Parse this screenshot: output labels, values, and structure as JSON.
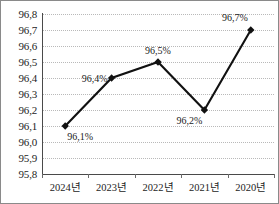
{
  "chart_data": {
    "type": "line",
    "title": "",
    "xlabel": "",
    "ylabel": "",
    "categories": [
      "2024년",
      "2023년",
      "2022년",
      "2021년",
      "2020년"
    ],
    "values": [
      96.1,
      96.4,
      96.5,
      96.2,
      96.7
    ],
    "point_labels": [
      "96,1%",
      "96,4%",
      "96,5%",
      "96,2%",
      "96,7%"
    ],
    "ylim": [
      95.8,
      96.8
    ],
    "ytick_labels": [
      "96,8",
      "96,7",
      "96,6",
      "96,5",
      "96,4",
      "96,3",
      "96,2",
      "96,1",
      "96,0",
      "95,9",
      "95,8"
    ],
    "ytick_values": [
      96.8,
      96.7,
      96.6,
      96.5,
      96.4,
      96.3,
      96.2,
      96.1,
      96.0,
      95.9,
      95.8
    ],
    "grid": true,
    "legend": "none",
    "decimal_separator": ",",
    "series": [
      {
        "name": "",
        "values": [
          96.1,
          96.4,
          96.5,
          96.2,
          96.7
        ]
      }
    ],
    "colors": {
      "line": "#111111",
      "marker": "#111111",
      "grid": "#b9b9b9",
      "axis": "#4a4a4a",
      "border": "#8a8a8a",
      "text": "#242424"
    }
  }
}
